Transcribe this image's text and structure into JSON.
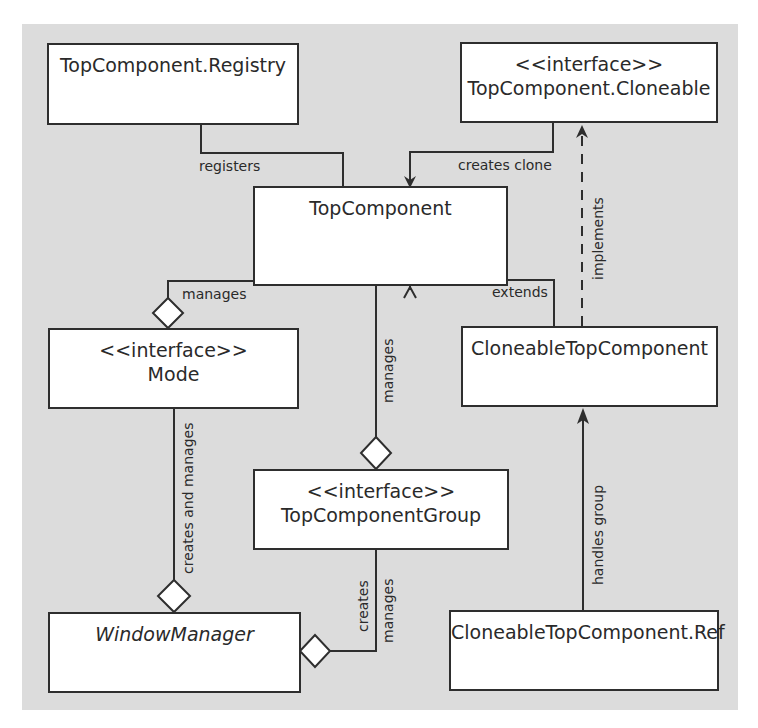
{
  "diagram": {
    "type": "uml-class-diagram",
    "colors": {
      "background": "#dcdcdc",
      "box_fill": "#ffffff",
      "stroke": "#2e2e2e",
      "text": "#2a2a2a"
    },
    "nodes": {
      "registry": {
        "stereotype": "",
        "name": "TopComponent.Registry"
      },
      "cloneable": {
        "stereotype": "<<interface>>",
        "name": "TopComponent.Cloneable"
      },
      "topcomponent": {
        "stereotype": "",
        "name": "TopComponent"
      },
      "mode": {
        "stereotype": "<<interface>>",
        "name": "Mode"
      },
      "cloneable_tc": {
        "stereotype": "",
        "name": "CloneableTopComponent"
      },
      "tc_group": {
        "stereotype": "<<interface>>",
        "name": "TopComponentGroup"
      },
      "window_manager": {
        "stereotype": "",
        "name": "WindowManager",
        "italic": true
      },
      "cloneable_ref": {
        "stereotype": "",
        "name": "CloneableTopComponent.Ref"
      }
    },
    "edges": {
      "registers": {
        "label": "registers",
        "from": "TopComponent.Registry",
        "to": "TopComponent",
        "kind": "association"
      },
      "creates_clone": {
        "label": "creates clone",
        "from": "TopComponent.Cloneable",
        "to": "TopComponent",
        "kind": "directed-association"
      },
      "implements": {
        "label": "implements",
        "from": "CloneableTopComponent",
        "to": "TopComponent.Cloneable",
        "kind": "realization"
      },
      "extends": {
        "label": "extends",
        "from": "CloneableTopComponent",
        "to": "TopComponent",
        "kind": "generalization"
      },
      "mode_manages": {
        "label": "manages",
        "from": "Mode",
        "to": "TopComponent",
        "kind": "aggregation"
      },
      "group_manages": {
        "label": "manages",
        "from": "TopComponentGroup",
        "to": "TopComponent",
        "kind": "aggregation"
      },
      "creates_and_manages": {
        "label": "creates and manages",
        "from": "WindowManager",
        "to": "Mode",
        "kind": "aggregation"
      },
      "creates": {
        "label": "creates",
        "from": "WindowManager",
        "to": "TopComponentGroup",
        "kind": "aggregation"
      },
      "wm_manages": {
        "label": "manages",
        "from": "WindowManager",
        "to": "TopComponentGroup",
        "kind": "aggregation"
      },
      "handles_group": {
        "label": "handles group",
        "from": "CloneableTopComponent.Ref",
        "to": "CloneableTopComponent",
        "kind": "directed-association"
      }
    }
  }
}
